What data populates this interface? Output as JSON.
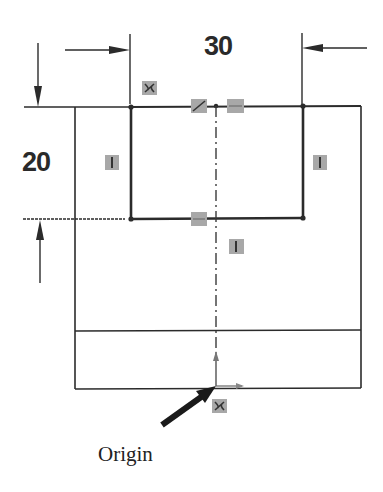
{
  "diagram": {
    "type": "cad-sketch",
    "dimensions": {
      "width_label": "30",
      "height_label": "20"
    },
    "labels": {
      "origin": "Origin"
    },
    "relations": [
      {
        "name": "coincident",
        "position": "top-left-corner"
      },
      {
        "name": "midpoint",
        "position": "top-edge-center"
      },
      {
        "name": "horizontal",
        "position": "top-edge-right-of-center"
      },
      {
        "name": "vertical",
        "position": "left-slot-edge"
      },
      {
        "name": "vertical",
        "position": "right-slot-edge"
      },
      {
        "name": "horizontal",
        "position": "bottom-slot-edge"
      },
      {
        "name": "vertical",
        "position": "centerline"
      },
      {
        "name": "coincident",
        "position": "origin"
      }
    ],
    "colors": {
      "line": "#2b2b2b",
      "relation_icon": "#a8a8a8",
      "background": "#ffffff"
    }
  }
}
